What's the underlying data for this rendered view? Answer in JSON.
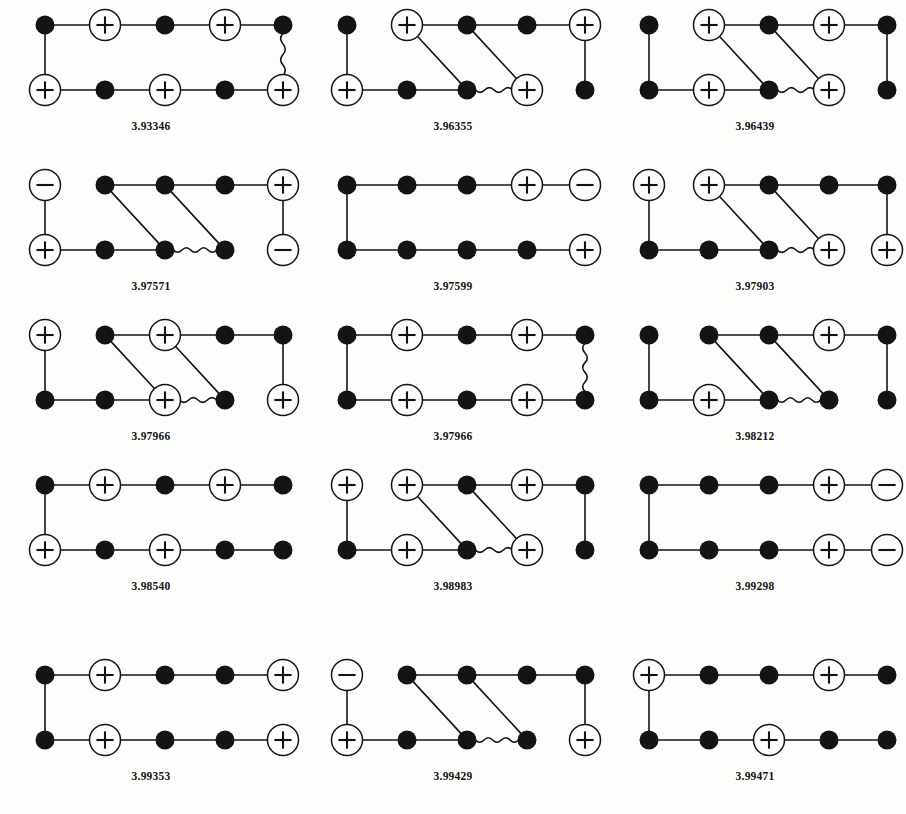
{
  "document": {
    "kind": "figure-plate",
    "description": "Plate of fifteen small signed graph diagrams, each labelled with a numeric value beneath it.",
    "background_color": "#fdfdfc",
    "ink_color": "#141414"
  },
  "legend": {
    "node_filled": "filled-disc-vertex",
    "node_plus": "circled-plus-vertex",
    "node_minus": "circled-minus-vertex",
    "edge_straight": "straight-edge",
    "edge_wavy": "wavy-edge"
  },
  "layout": {
    "columns": 3,
    "rows": 5,
    "panel_width": 302,
    "panel_height": 160
  },
  "chart_data": {
    "type": "diagram-grid",
    "title": "",
    "value_label": "eigenvalue",
    "values": [
      "3.93346",
      "3.96355",
      "3.96439",
      "3.97571",
      "3.97599",
      "3.97903",
      "3.97966",
      "3.97966",
      "3.98212",
      "3.98540",
      "3.98983",
      "3.99298",
      "3.99353",
      "3.99429",
      "3.99471"
    ]
  },
  "panels": [
    {
      "id": "panel-1",
      "caption": "3.93346",
      "top_row": [
        "dot",
        "plus",
        "dot",
        "plus",
        "dot"
      ],
      "bottom_row": [
        "plus",
        "dot",
        "plus",
        "dot",
        "plus"
      ],
      "top_edges": [
        true,
        true,
        true,
        true
      ],
      "bottom_edges": [
        true,
        true,
        true,
        true
      ],
      "verticals": [
        {
          "col": 0,
          "style": "straight"
        },
        {
          "col": 4,
          "style": "wavy"
        }
      ],
      "diagonals": []
    },
    {
      "id": "panel-2",
      "caption": "3.96355",
      "top_row": [
        "dot",
        "plus",
        "dot",
        "dot",
        "plus"
      ],
      "bottom_row": [
        "plus",
        "dot",
        "dot",
        "plus",
        "dot"
      ],
      "top_edges": [
        false,
        true,
        true,
        true
      ],
      "bottom_edges": [
        true,
        true,
        "wavy",
        false
      ],
      "verticals": [
        {
          "col": 0,
          "style": "straight"
        },
        {
          "col": 4,
          "style": "straight"
        }
      ],
      "diagonals": [
        {
          "from_top": 1,
          "to_bottom": 2
        },
        {
          "from_top": 2,
          "to_bottom": 3
        }
      ]
    },
    {
      "id": "panel-3",
      "caption": "3.96439",
      "top_row": [
        "dot",
        "plus",
        "dot",
        "plus",
        "dot"
      ],
      "bottom_row": [
        "dot",
        "plus",
        "dot",
        "plus",
        "dot"
      ],
      "top_edges": [
        false,
        true,
        true,
        true
      ],
      "bottom_edges": [
        true,
        true,
        "wavy",
        false
      ],
      "verticals": [
        {
          "col": 0,
          "style": "straight"
        },
        {
          "col": 4,
          "style": "straight"
        }
      ],
      "diagonals": [
        {
          "from_top": 1,
          "to_bottom": 2
        },
        {
          "from_top": 2,
          "to_bottom": 3
        }
      ]
    },
    {
      "id": "panel-4",
      "caption": "3.97571",
      "top_row": [
        "minus",
        "dot",
        "dot",
        "dot",
        "plus"
      ],
      "bottom_row": [
        "plus",
        "dot",
        "dot",
        "dot",
        "minus"
      ],
      "top_edges": [
        false,
        true,
        true,
        true
      ],
      "bottom_edges": [
        true,
        true,
        "wavy",
        false
      ],
      "verticals": [
        {
          "col": 0,
          "style": "straight"
        },
        {
          "col": 4,
          "style": "straight"
        }
      ],
      "diagonals": [
        {
          "from_top": 1,
          "to_bottom": 2
        },
        {
          "from_top": 2,
          "to_bottom": 3
        }
      ]
    },
    {
      "id": "panel-5",
      "caption": "3.97599",
      "top_row": [
        "dot",
        "dot",
        "dot",
        "plus",
        "minus"
      ],
      "bottom_row": [
        "dot",
        "dot",
        "dot",
        "dot",
        "plus"
      ],
      "top_edges": [
        true,
        true,
        true,
        true
      ],
      "bottom_edges": [
        true,
        true,
        true,
        true
      ],
      "verticals": [
        {
          "col": 0,
          "style": "straight"
        }
      ],
      "diagonals": []
    },
    {
      "id": "panel-6",
      "caption": "3.97903",
      "top_row": [
        "plus",
        "plus",
        "dot",
        "dot",
        "dot"
      ],
      "bottom_row": [
        "dot",
        "dot",
        "dot",
        "plus",
        "plus"
      ],
      "top_edges": [
        false,
        true,
        true,
        true
      ],
      "bottom_edges": [
        true,
        true,
        "wavy",
        false
      ],
      "verticals": [
        {
          "col": 0,
          "style": "straight"
        },
        {
          "col": 4,
          "style": "straight"
        }
      ],
      "diagonals": [
        {
          "from_top": 1,
          "to_bottom": 2
        },
        {
          "from_top": 2,
          "to_bottom": 3
        }
      ]
    },
    {
      "id": "panel-7",
      "caption": "3.97966",
      "top_row": [
        "plus",
        "dot",
        "plus",
        "dot",
        "dot"
      ],
      "bottom_row": [
        "dot",
        "dot",
        "plus",
        "dot",
        "plus"
      ],
      "top_edges": [
        false,
        true,
        true,
        true
      ],
      "bottom_edges": [
        true,
        true,
        "wavy",
        false
      ],
      "verticals": [
        {
          "col": 0,
          "style": "straight"
        },
        {
          "col": 4,
          "style": "straight"
        }
      ],
      "diagonals": [
        {
          "from_top": 1,
          "to_bottom": 2
        },
        {
          "from_top": 2,
          "to_bottom": 3
        }
      ]
    },
    {
      "id": "panel-8",
      "caption": "3.97966",
      "top_row": [
        "dot",
        "plus",
        "dot",
        "plus",
        "dot"
      ],
      "bottom_row": [
        "dot",
        "plus",
        "dot",
        "plus",
        "dot"
      ],
      "top_edges": [
        true,
        true,
        true,
        true
      ],
      "bottom_edges": [
        true,
        true,
        true,
        true
      ],
      "verticals": [
        {
          "col": 0,
          "style": "straight"
        },
        {
          "col": 4,
          "style": "wavy"
        }
      ],
      "diagonals": []
    },
    {
      "id": "panel-9",
      "caption": "3.98212",
      "top_row": [
        "dot",
        "dot",
        "dot",
        "plus",
        "dot"
      ],
      "bottom_row": [
        "dot",
        "plus",
        "dot",
        "dot",
        "dot"
      ],
      "top_edges": [
        false,
        true,
        true,
        true
      ],
      "bottom_edges": [
        true,
        true,
        "wavy",
        false
      ],
      "verticals": [
        {
          "col": 0,
          "style": "straight"
        },
        {
          "col": 4,
          "style": "straight"
        }
      ],
      "diagonals": [
        {
          "from_top": 1,
          "to_bottom": 2
        },
        {
          "from_top": 2,
          "to_bottom": 3
        }
      ]
    },
    {
      "id": "panel-10",
      "caption": "3.98540",
      "top_row": [
        "dot",
        "plus",
        "dot",
        "plus",
        "dot"
      ],
      "bottom_row": [
        "plus",
        "dot",
        "plus",
        "dot",
        "dot"
      ],
      "top_edges": [
        true,
        true,
        true,
        true
      ],
      "bottom_edges": [
        true,
        true,
        true,
        true
      ],
      "verticals": [
        {
          "col": 0,
          "style": "straight"
        }
      ],
      "diagonals": []
    },
    {
      "id": "panel-11",
      "caption": "3.98983",
      "top_row": [
        "plus",
        "plus",
        "dot",
        "plus",
        "dot"
      ],
      "bottom_row": [
        "dot",
        "plus",
        "dot",
        "plus",
        "dot"
      ],
      "top_edges": [
        false,
        true,
        true,
        true
      ],
      "bottom_edges": [
        true,
        true,
        "wavy",
        false
      ],
      "verticals": [
        {
          "col": 0,
          "style": "straight"
        },
        {
          "col": 4,
          "style": "straight"
        }
      ],
      "diagonals": [
        {
          "from_top": 1,
          "to_bottom": 2
        },
        {
          "from_top": 2,
          "to_bottom": 3
        }
      ]
    },
    {
      "id": "panel-12",
      "caption": "3.99298",
      "top_row": [
        "dot",
        "dot",
        "dot",
        "plus",
        "minus"
      ],
      "bottom_row": [
        "dot",
        "dot",
        "dot",
        "plus",
        "minus"
      ],
      "top_edges": [
        true,
        true,
        true,
        true
      ],
      "bottom_edges": [
        true,
        true,
        true,
        true
      ],
      "verticals": [
        {
          "col": 0,
          "style": "straight"
        }
      ],
      "diagonals": []
    },
    {
      "id": "panel-13",
      "caption": "3.99353",
      "top_row": [
        "dot",
        "plus",
        "dot",
        "dot",
        "plus"
      ],
      "bottom_row": [
        "dot",
        "plus",
        "dot",
        "dot",
        "plus"
      ],
      "top_edges": [
        true,
        true,
        true,
        true
      ],
      "bottom_edges": [
        true,
        true,
        true,
        true
      ],
      "verticals": [
        {
          "col": 0,
          "style": "straight"
        }
      ],
      "diagonals": []
    },
    {
      "id": "panel-14",
      "caption": "3.99429",
      "top_row": [
        "minus",
        "dot",
        "dot",
        "dot",
        "dot"
      ],
      "bottom_row": [
        "plus",
        "dot",
        "dot",
        "dot",
        "plus"
      ],
      "top_edges": [
        false,
        true,
        true,
        true
      ],
      "bottom_edges": [
        true,
        true,
        "wavy",
        false
      ],
      "verticals": [
        {
          "col": 0,
          "style": "straight"
        },
        {
          "col": 4,
          "style": "straight"
        }
      ],
      "diagonals": [
        {
          "from_top": 1,
          "to_bottom": 2
        },
        {
          "from_top": 2,
          "to_bottom": 3
        }
      ]
    },
    {
      "id": "panel-15",
      "caption": "3.99471",
      "top_row": [
        "plus",
        "dot",
        "dot",
        "plus",
        "dot"
      ],
      "bottom_row": [
        "dot",
        "dot",
        "plus",
        "dot",
        "dot"
      ],
      "top_edges": [
        true,
        true,
        true,
        true
      ],
      "bottom_edges": [
        true,
        true,
        true,
        true
      ],
      "verticals": [
        {
          "col": 0,
          "style": "straight"
        }
      ],
      "diagonals": []
    }
  ]
}
